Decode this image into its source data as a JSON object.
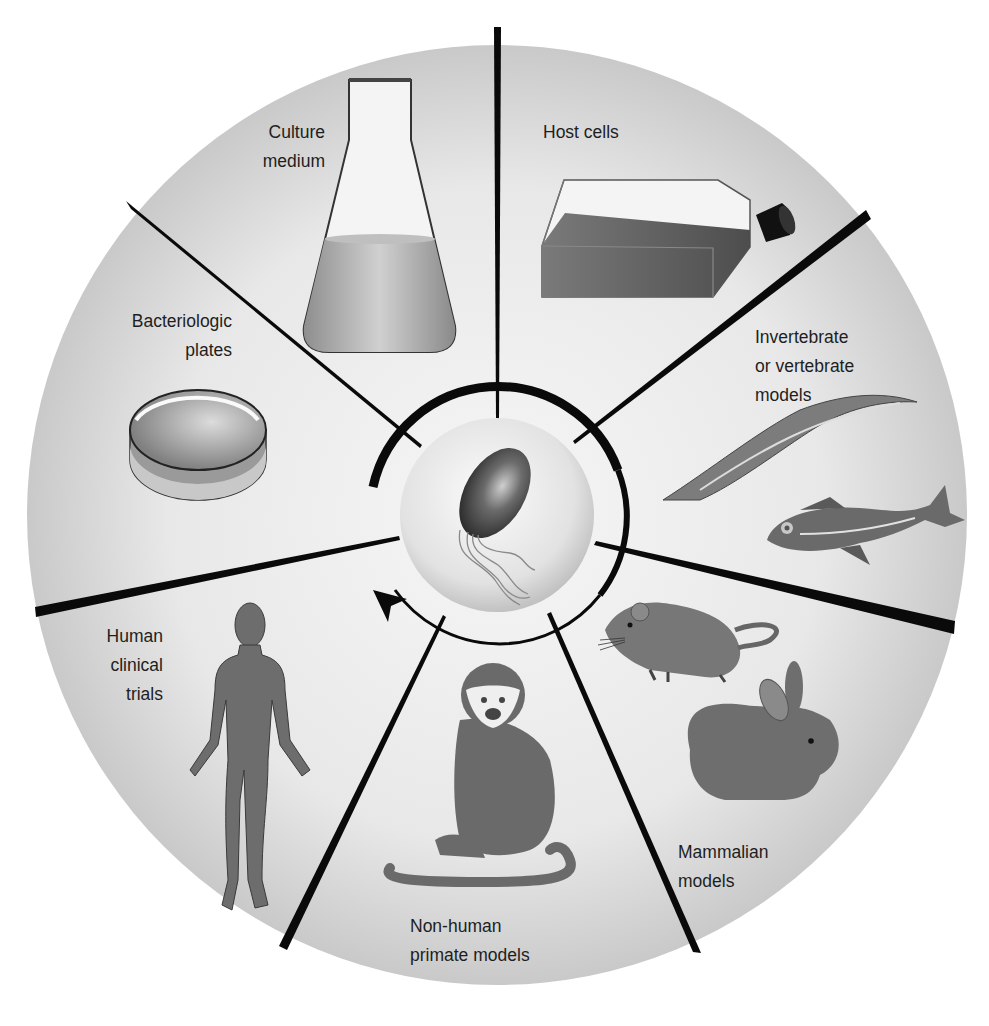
{
  "diagram": {
    "title": "",
    "center": {
      "label": "",
      "icon": "flagellated-bacterium-in-sphere"
    },
    "cycle_arrow": {
      "direction": "counterclockwise",
      "note": "arrow returns from bottom toward left/top"
    },
    "segments": [
      {
        "id": "culture-medium",
        "lines": [
          "Culture",
          "medium"
        ],
        "icon": "erlenmeyer-flask"
      },
      {
        "id": "host-cells",
        "lines": [
          "Host cells"
        ],
        "icon": "cell-culture-flask"
      },
      {
        "id": "invertebrate-vertebrate",
        "lines": [
          "Invertebrate",
          "or vertebrate",
          "models"
        ],
        "icon": "worm-and-fish"
      },
      {
        "id": "mammalian",
        "lines": [
          "Mammalian",
          "models"
        ],
        "icon": "mouse-and-rabbit"
      },
      {
        "id": "non-human-primate",
        "lines": [
          "Non-human",
          "primate models"
        ],
        "icon": "monkey"
      },
      {
        "id": "human-clinical",
        "lines": [
          "Human",
          "clinical",
          "trials"
        ],
        "icon": "human-figure"
      },
      {
        "id": "bacteriologic-plates",
        "lines": [
          "Bacteriologic",
          "plates"
        ],
        "icon": "petri-dish"
      }
    ]
  },
  "colors": {
    "disc": "#e4e4e4",
    "disc_edge": "#c4c4c4",
    "divider": "#0a0a0a",
    "figure_fill": "#6f6f6f",
    "figure_dark": "#555555",
    "text": "#1e1e1e"
  }
}
